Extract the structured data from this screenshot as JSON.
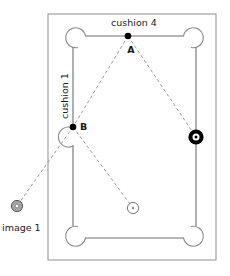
{
  "diagram": {
    "labels": {
      "cushion_top": "cushion 4",
      "cushion_left": "cushion 1",
      "point_a": "A",
      "point_b": "B",
      "image_ball": "image 1"
    },
    "colors": {
      "frame": "#9a9a9a",
      "cushion": "#6e6e6e",
      "pocket": "#8c8c8c",
      "dashed_path": "#9a9a9a",
      "point_marker": "#000000",
      "object_ball_ring": "#000000",
      "object_ball_center": "#ffffff",
      "cue_ball_outline": "#777777",
      "cue_ball_fill": "#ffffff",
      "image_ball_fill": "#a6a6a6",
      "image_ball_outline": "#555555",
      "text": "#1a1a1a",
      "background": "#ffffff"
    },
    "geometry": {
      "frame": {
        "x": 48,
        "y": 14,
        "width": 168,
        "height": 246
      },
      "cushion_rect": {
        "x": 73,
        "y": 36,
        "width": 123,
        "height": 202
      },
      "pockets": [
        {
          "name": "pocket-top-left",
          "cx": 78,
          "cy": 41,
          "r": 10
        },
        {
          "name": "pocket-top-right",
          "cx": 191,
          "cy": 41,
          "r": 10
        },
        {
          "name": "pocket-side-left",
          "cx": 78,
          "cy": 137,
          "r": 10
        },
        {
          "name": "pocket-bottom-left",
          "cx": 78,
          "cy": 233,
          "r": 10
        },
        {
          "name": "pocket-bottom-right",
          "cx": 191,
          "cy": 233,
          "r": 10
        }
      ],
      "points": [
        {
          "name": "point-a",
          "cx": 128,
          "cy": 36,
          "r": 3.2
        },
        {
          "name": "point-b",
          "cx": 73,
          "cy": 127,
          "r": 3.2
        }
      ],
      "balls": [
        {
          "name": "object-ball-black",
          "cx": 196,
          "cy": 137,
          "r": 7.5
        },
        {
          "name": "cue-ball",
          "cx": 133,
          "cy": 208,
          "r": 5.5
        },
        {
          "name": "image-ball",
          "cx": 17,
          "cy": 206,
          "r": 5.5
        }
      ],
      "paths": [
        {
          "name": "path-a-to-object-ball",
          "x1": 128,
          "y1": 36,
          "x2": 196,
          "y2": 137
        },
        {
          "name": "path-a-to-b",
          "x1": 128,
          "y1": 36,
          "x2": 73,
          "y2": 127
        },
        {
          "name": "path-b-to-cue-ball",
          "x1": 73,
          "y1": 127,
          "x2": 133,
          "y2": 208
        },
        {
          "name": "path-b-to-image-ball",
          "x1": 73,
          "y1": 127,
          "x2": 17,
          "y2": 206
        }
      ],
      "label_positions": {
        "cushion_top": {
          "x": 134,
          "y": 26
        },
        "cushion_left": {
          "x": 68,
          "y": 96,
          "rotation": -90
        },
        "point_a": {
          "x": 131,
          "y": 52
        },
        "point_b": {
          "x": 81,
          "y": 128
        },
        "image_ball": {
          "x": 2,
          "y": 231
        }
      }
    }
  }
}
